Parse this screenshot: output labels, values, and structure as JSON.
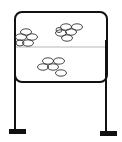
{
  "diagram": {
    "type": "line-drawing",
    "colors": {
      "stroke": "#111111",
      "divider": "#b8b8b8",
      "background": "#ffffff"
    },
    "clusters": [
      {
        "name": "upper-left-cluster",
        "ellipse_count": 5
      },
      {
        "name": "upper-right-cluster",
        "ellipse_count": 6
      },
      {
        "name": "lower-cluster",
        "ellipse_count": 6
      }
    ]
  }
}
